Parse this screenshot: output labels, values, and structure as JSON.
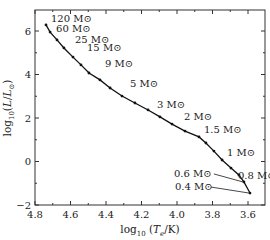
{
  "chart_data": {
    "type": "line",
    "title": "",
    "xlabel": "log10 (Te/K)",
    "ylabel": "log10(L/L⊙)",
    "xlim": [
      4.8,
      3.55
    ],
    "ylim": [
      -2,
      6.95
    ],
    "x_inverted": true,
    "grid": false,
    "x_ticks": [
      4.8,
      4.6,
      4.4,
      4.2,
      4.0,
      3.8,
      3.6
    ],
    "x_tick_labels": [
      "4.8",
      "4.6",
      "4.4",
      "4.2",
      "4.0",
      "3.8",
      "3.6"
    ],
    "y_ticks": [
      -2,
      0,
      2,
      4,
      6
    ],
    "y_tick_labels": [
      "−2",
      "0",
      "2",
      "4",
      "6"
    ],
    "series": [
      {
        "name": "Zero-age main sequence",
        "x": [
          4.738,
          4.715,
          4.676,
          4.637,
          4.586,
          4.541,
          4.496,
          4.434,
          4.377,
          4.31,
          4.237,
          4.163,
          4.096,
          4.028,
          3.955,
          3.876,
          3.837,
          3.792,
          3.746,
          3.696,
          3.651,
          3.623,
          3.589
        ],
        "y": [
          6.28,
          5.95,
          5.59,
          5.22,
          4.8,
          4.44,
          4.07,
          3.75,
          3.38,
          3.01,
          2.69,
          2.37,
          2.05,
          1.72,
          1.4,
          1.13,
          0.85,
          0.48,
          0.07,
          -0.3,
          -0.62,
          -0.94,
          -1.45
        ],
        "color": "#111111"
      }
    ],
    "annotations": [
      {
        "text": "120 M⊙",
        "x": 4.738,
        "y": 6.28
      },
      {
        "text": "60 M⊙",
        "x": 4.715,
        "y": 5.95
      },
      {
        "text": "25 M⊙",
        "x": 4.637,
        "y": 5.22
      },
      {
        "text": "15 M⊙",
        "x": 4.586,
        "y": 4.8
      },
      {
        "text": "9 M⊙",
        "x": 4.496,
        "y": 4.07
      },
      {
        "text": "5 M⊙",
        "x": 4.31,
        "y": 3.01
      },
      {
        "text": "3 M⊙",
        "x": 4.163,
        "y": 2.37
      },
      {
        "text": "2 M⊙",
        "x": 4.028,
        "y": 1.72
      },
      {
        "text": "1.5 M⊙",
        "x": 3.876,
        "y": 1.13
      },
      {
        "text": "1 M⊙",
        "x": 3.746,
        "y": 0.07
      },
      {
        "text": "0.8 M⊙",
        "x": 3.651,
        "y": -0.62
      },
      {
        "text": "0.6 M⊙",
        "x": 3.623,
        "y": -0.94
      },
      {
        "text": "0.4 M⊙",
        "x": 3.589,
        "y": -1.45
      }
    ]
  },
  "labels": {
    "x_axis": "log₁₀ (Tₑ/K)",
    "y_axis": "log₁₀(L/L⊙)"
  }
}
